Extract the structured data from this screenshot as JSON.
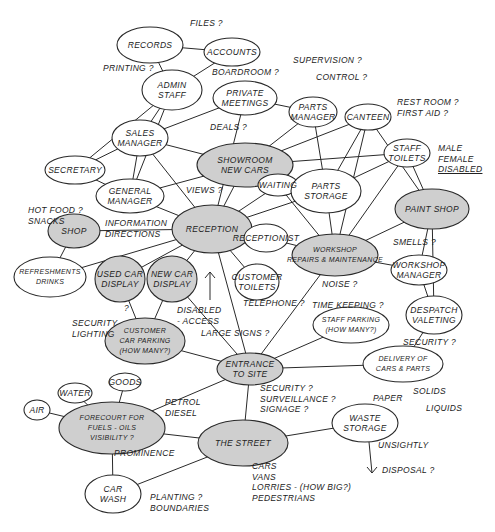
{
  "diagram": {
    "type": "bubble-diagram",
    "style": "hand-drawn sketch",
    "nodes": [
      {
        "id": "records",
        "label": "RECORDS",
        "x": 150,
        "y": 45,
        "rx": 33,
        "ry": 18,
        "shaded": false
      },
      {
        "id": "accounts",
        "label": "ACCOUNTS",
        "x": 232,
        "y": 52,
        "rx": 28,
        "ry": 14,
        "shaded": false
      },
      {
        "id": "admin_staff",
        "label": "ADMIN\nSTAFF",
        "x": 172,
        "y": 90,
        "rx": 30,
        "ry": 20,
        "shaded": false
      },
      {
        "id": "private_meetings",
        "label": "PRIVATE\nMEETINGS",
        "x": 245,
        "y": 98,
        "rx": 32,
        "ry": 17,
        "shaded": false
      },
      {
        "id": "sales_manager",
        "label": "SALES\nMANAGER",
        "x": 140,
        "y": 138,
        "rx": 28,
        "ry": 18,
        "shaded": false
      },
      {
        "id": "secretary",
        "label": "SECRETARY",
        "x": 75,
        "y": 170,
        "rx": 30,
        "ry": 14,
        "shaded": false
      },
      {
        "id": "showroom",
        "label": "SHOWROOM\nNEW CARS",
        "x": 245,
        "y": 165,
        "rx": 48,
        "ry": 22,
        "shaded": true
      },
      {
        "id": "parts_manager",
        "label": "PARTS\nMANAGER",
        "x": 313,
        "y": 112,
        "rx": 24,
        "ry": 15,
        "shaded": false
      },
      {
        "id": "canteen",
        "label": "CANTEEN",
        "x": 368,
        "y": 117,
        "rx": 23,
        "ry": 13,
        "shaded": false
      },
      {
        "id": "staff_toilets",
        "label": "STAFF\nTOILETS",
        "x": 407,
        "y": 153,
        "rx": 23,
        "ry": 14,
        "shaded": false
      },
      {
        "id": "general_manager",
        "label": "GENERAL\nMANAGER",
        "x": 130,
        "y": 196,
        "rx": 34,
        "ry": 17,
        "shaded": false
      },
      {
        "id": "waiting",
        "label": "WAITING",
        "x": 278,
        "y": 185,
        "rx": 20,
        "ry": 11,
        "shaded": false
      },
      {
        "id": "parts_storage",
        "label": "PARTS\nSTORAGE",
        "x": 326,
        "y": 191,
        "rx": 35,
        "ry": 22,
        "shaded": false
      },
      {
        "id": "shop",
        "label": "SHOP",
        "x": 74,
        "y": 231,
        "rx": 26,
        "ry": 17,
        "shaded": true
      },
      {
        "id": "reception",
        "label": "RECEPTION",
        "x": 212,
        "y": 229,
        "rx": 40,
        "ry": 24,
        "shaded": true
      },
      {
        "id": "paint_shop",
        "label": "PAINT SHOP",
        "x": 432,
        "y": 209,
        "rx": 37,
        "ry": 20,
        "shaded": true
      },
      {
        "id": "receptionist",
        "label": "RECEPTIONIST",
        "x": 266,
        "y": 238,
        "rx": 22,
        "ry": 14,
        "shaded": false
      },
      {
        "id": "workshop",
        "label": "WORKSHOP\nREPAIRS & MAINTENANCE",
        "x": 335,
        "y": 255,
        "rx": 43,
        "ry": 21,
        "shaded": true
      },
      {
        "id": "refreshments",
        "label": "REFRESHMENTS\nDRINKS",
        "x": 50,
        "y": 277,
        "rx": 36,
        "ry": 20,
        "shaded": false
      },
      {
        "id": "used_car_display",
        "label": "USED CAR\nDISPLAY",
        "x": 120,
        "y": 279,
        "rx": 25,
        "ry": 23,
        "shaded": true
      },
      {
        "id": "new_car_display",
        "label": "NEW CAR\nDISPLAY",
        "x": 172,
        "y": 279,
        "rx": 25,
        "ry": 23,
        "shaded": true
      },
      {
        "id": "workshop_manager",
        "label": "WORKSHOP\nMANAGER",
        "x": 419,
        "y": 270,
        "rx": 28,
        "ry": 15,
        "shaded": false
      },
      {
        "id": "customer_toilets",
        "label": "CUSTOMER\nTOILETS",
        "x": 257,
        "y": 282,
        "rx": 22,
        "ry": 18,
        "shaded": false
      },
      {
        "id": "customer_car_parking",
        "label": "CUSTOMER\nCAR PARKING\n(HOW MANY?)",
        "x": 145,
        "y": 341,
        "rx": 40,
        "ry": 23,
        "shaded": true
      },
      {
        "id": "staff_parking",
        "label": "STAFF PARKING\n(HOW MANY?)",
        "x": 351,
        "y": 325,
        "rx": 38,
        "ry": 18,
        "shaded": false
      },
      {
        "id": "despatch_valeting",
        "label": "DESPATCH\nVALETING",
        "x": 434,
        "y": 315,
        "rx": 28,
        "ry": 19,
        "shaded": false
      },
      {
        "id": "entrance",
        "label": "ENTRANCE\nTO SITE",
        "x": 250,
        "y": 369,
        "rx": 33,
        "ry": 16,
        "shaded": true
      },
      {
        "id": "delivery",
        "label": "DELIVERY OF\nCARS & PARTS",
        "x": 403,
        "y": 364,
        "rx": 40,
        "ry": 18,
        "shaded": false
      },
      {
        "id": "air",
        "label": "AIR",
        "x": 37,
        "y": 410,
        "rx": 13,
        "ry": 10,
        "shaded": false
      },
      {
        "id": "water",
        "label": "WATER",
        "x": 75,
        "y": 393,
        "rx": 17,
        "ry": 10,
        "shaded": false
      },
      {
        "id": "goods",
        "label": "GOODS",
        "x": 125,
        "y": 382,
        "rx": 16,
        "ry": 9,
        "shaded": false
      },
      {
        "id": "forecourt",
        "label": "FORECOURT FOR\nFUELS - OILS\nVISIBILITY ?",
        "x": 112,
        "y": 428,
        "rx": 53,
        "ry": 26,
        "shaded": true
      },
      {
        "id": "waste_storage",
        "label": "WASTE\nSTORAGE",
        "x": 365,
        "y": 423,
        "rx": 33,
        "ry": 19,
        "shaded": false
      },
      {
        "id": "the_street",
        "label": "THE STREET",
        "x": 243,
        "y": 443,
        "rx": 45,
        "ry": 23,
        "shaded": true
      },
      {
        "id": "car_wash",
        "label": "CAR\nWASH",
        "x": 113,
        "y": 494,
        "rx": 28,
        "ry": 19,
        "shaded": false
      }
    ],
    "annotations": [
      {
        "id": "files",
        "text": "FILES ?",
        "x": 190,
        "y": 18
      },
      {
        "id": "printing",
        "text": "PRINTING ?",
        "x": 103,
        "y": 63
      },
      {
        "id": "boardroom",
        "text": "BOARDROOM ?",
        "x": 212,
        "y": 67
      },
      {
        "id": "supervision",
        "text": "SUPERVISION ?",
        "x": 293,
        "y": 55
      },
      {
        "id": "control",
        "text": "CONTROL ?",
        "x": 316,
        "y": 72
      },
      {
        "id": "restroom",
        "text": "REST ROOM ?\nFIRST AID ?",
        "x": 397,
        "y": 97
      },
      {
        "id": "deals",
        "text": "DEALS ?",
        "x": 210,
        "y": 122
      },
      {
        "id": "male_female_disabled",
        "text": "MALE\nFEMALE\nDISABLED",
        "x": 438,
        "y": 143,
        "underline_last": true
      },
      {
        "id": "views",
        "text": "VIEWS ?",
        "x": 186,
        "y": 185
      },
      {
        "id": "hot_food",
        "text": "HOT FOOD ?\nSNACKS",
        "x": 28,
        "y": 205
      },
      {
        "id": "information",
        "text": "INFORMATION\nDIRECTIONS",
        "x": 105,
        "y": 218
      },
      {
        "id": "smells",
        "text": "SMELLS ?",
        "x": 393,
        "y": 237
      },
      {
        "id": "noise",
        "text": "NOISE ?",
        "x": 322,
        "y": 279
      },
      {
        "id": "telephone",
        "text": "TELEPHONE ?",
        "x": 243,
        "y": 298
      },
      {
        "id": "time_keeping",
        "text": "TIME KEEPING ?",
        "x": 312,
        "y": 300
      },
      {
        "id": "disabled_access",
        "text": "DISABLED\n- ACCESS",
        "x": 177,
        "y": 305
      },
      {
        "id": "security_lighting",
        "text": "SECURITY\nLIGHTING",
        "x": 72,
        "y": 318
      },
      {
        "id": "q_used",
        "text": "?",
        "x": 124,
        "y": 303
      },
      {
        "id": "large_signs",
        "text": "LARGE SIGNS ?",
        "x": 201,
        "y": 328
      },
      {
        "id": "security_right",
        "text": "SECURITY ?",
        "x": 403,
        "y": 337
      },
      {
        "id": "security_surveillance",
        "text": "SECURITY ?\nSURVEILLANCE ?\nSIGNAGE ?",
        "x": 260,
        "y": 383
      },
      {
        "id": "paper",
        "text": "PAPER",
        "x": 373,
        "y": 393
      },
      {
        "id": "solids",
        "text": "SOLIDS",
        "x": 413,
        "y": 386
      },
      {
        "id": "liquids",
        "text": "LIQUIDS",
        "x": 426,
        "y": 403
      },
      {
        "id": "petrol_diesel",
        "text": "PETROL\nDIESEL",
        "x": 165,
        "y": 397
      },
      {
        "id": "prominence",
        "text": "PROMINENCE",
        "x": 114,
        "y": 448
      },
      {
        "id": "unsightly",
        "text": "UNSIGHTLY",
        "x": 378,
        "y": 440
      },
      {
        "id": "disposal",
        "text": "DISPOSAL ?",
        "x": 382,
        "y": 465
      },
      {
        "id": "vehicles",
        "text": "CARS\nVANS\nLORRIES - (HOW BIG?)\nPEDESTRIANS",
        "x": 252,
        "y": 461
      },
      {
        "id": "planting",
        "text": "PLANTING ?\nBOUNDARIES",
        "x": 150,
        "y": 492
      }
    ],
    "edges": [
      [
        "records",
        "accounts"
      ],
      [
        "records",
        "admin_staff"
      ],
      [
        "accounts",
        "admin_staff"
      ],
      [
        "admin_staff",
        "sales_manager"
      ],
      [
        "admin_staff",
        "secretary"
      ],
      [
        "admin_staff",
        "general_manager"
      ],
      [
        "private_meetings",
        "sales_manager"
      ],
      [
        "private_meetings",
        "parts_manager"
      ],
      [
        "private_meetings",
        "reception"
      ],
      [
        "sales_manager",
        "secretary"
      ],
      [
        "sales_manager",
        "general_manager"
      ],
      [
        "sales_manager",
        "showroom"
      ],
      [
        "sales_manager",
        "reception"
      ],
      [
        "secretary",
        "general_manager"
      ],
      [
        "showroom",
        "parts_manager"
      ],
      [
        "showroom",
        "staff_toilets"
      ],
      [
        "showroom",
        "general_manager"
      ],
      [
        "showroom",
        "reception"
      ],
      [
        "showroom",
        "waiting"
      ],
      [
        "parts_manager",
        "parts_storage"
      ],
      [
        "canteen",
        "showroom"
      ],
      [
        "canteen",
        "parts_storage"
      ],
      [
        "canteen",
        "workshop"
      ],
      [
        "canteen",
        "paint_shop"
      ],
      [
        "staff_toilets",
        "parts_storage"
      ],
      [
        "staff_toilets",
        "workshop"
      ],
      [
        "staff_toilets",
        "paint_shop"
      ],
      [
        "general_manager",
        "reception"
      ],
      [
        "shop",
        "reception"
      ],
      [
        "shop",
        "refreshments"
      ],
      [
        "refreshments",
        "reception"
      ],
      [
        "reception",
        "waiting"
      ],
      [
        "reception",
        "receptionist"
      ],
      [
        "reception",
        "parts_storage"
      ],
      [
        "reception",
        "new_car_display"
      ],
      [
        "reception",
        "customer_toilets"
      ],
      [
        "reception",
        "entrance"
      ],
      [
        "reception",
        "used_car_display"
      ],
      [
        "waiting",
        "parts_storage"
      ],
      [
        "waiting",
        "workshop"
      ],
      [
        "receptionist",
        "workshop"
      ],
      [
        "parts_storage",
        "workshop"
      ],
      [
        "workshop",
        "paint_shop"
      ],
      [
        "workshop",
        "workshop_manager"
      ],
      [
        "workshop",
        "entrance"
      ],
      [
        "paint_shop",
        "workshop_manager"
      ],
      [
        "paint_shop",
        "despatch_valeting"
      ],
      [
        "workshop_manager",
        "despatch_valeting"
      ],
      [
        "despatch_valeting",
        "delivery"
      ],
      [
        "used_car_display",
        "customer_car_parking"
      ],
      [
        "new_car_display",
        "customer_car_parking"
      ],
      [
        "new_car_display",
        "entrance"
      ],
      [
        "customer_car_parking",
        "entrance"
      ],
      [
        "staff_parking",
        "entrance"
      ],
      [
        "entrance",
        "delivery"
      ],
      [
        "entrance",
        "forecourt"
      ],
      [
        "entrance",
        "the_street"
      ],
      [
        "air",
        "forecourt"
      ],
      [
        "water",
        "forecourt"
      ],
      [
        "goods",
        "forecourt"
      ],
      [
        "forecourt",
        "the_street"
      ],
      [
        "forecourt",
        "car_wash"
      ],
      [
        "car_wash",
        "the_street"
      ],
      [
        "the_street",
        "waste_storage"
      ]
    ]
  }
}
